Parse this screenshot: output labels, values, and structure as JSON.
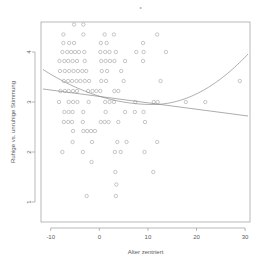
{
  "chart_data": {
    "type": "scatter",
    "title": "",
    "xlabel": "Alter zentriert",
    "ylabel": "Ruhige vs. unruhige Stimmung",
    "xlim": [
      -12,
      31
    ],
    "ylim": [
      0.6,
      4.6
    ],
    "xticks": [
      -10,
      0,
      10,
      20,
      30
    ],
    "xticklabels": [
      "-10",
      "0",
      "10",
      "20",
      "30"
    ],
    "yticks": [
      1,
      2,
      3,
      4
    ],
    "yticklabels": [
      "1",
      "2",
      "3",
      "4"
    ],
    "grid": false,
    "legend": "none",
    "point_marker": "open-circle",
    "point_color": "#9a9a9a",
    "line_color": "#8a8a8a",
    "points": [
      [
        -5.2,
        4.55
      ],
      [
        -3.3,
        4.55
      ],
      [
        -7.4,
        4.35
      ],
      [
        -3.3,
        4.35
      ],
      [
        1.1,
        4.35
      ],
      [
        3.0,
        4.35
      ],
      [
        11.9,
        4.35
      ],
      [
        -7.4,
        4.18
      ],
      [
        -6.2,
        4.18
      ],
      [
        -5.2,
        4.18
      ],
      [
        0.3,
        4.18
      ],
      [
        1.5,
        4.18
      ],
      [
        9.0,
        4.18
      ],
      [
        -7.6,
        4.0
      ],
      [
        -6.6,
        4.0
      ],
      [
        -5.8,
        4.0
      ],
      [
        -5.0,
        4.0
      ],
      [
        -4.2,
        4.0
      ],
      [
        -3.1,
        4.0
      ],
      [
        0.2,
        4.0
      ],
      [
        1.2,
        4.0
      ],
      [
        2.1,
        4.0
      ],
      [
        3.4,
        4.0
      ],
      [
        7.6,
        4.0
      ],
      [
        9.1,
        4.0
      ],
      [
        13.7,
        4.0
      ],
      [
        -8.2,
        3.82
      ],
      [
        -7.2,
        3.82
      ],
      [
        -6.4,
        3.82
      ],
      [
        -5.5,
        3.82
      ],
      [
        -4.6,
        3.82
      ],
      [
        -3.0,
        3.82
      ],
      [
        0.4,
        3.82
      ],
      [
        1.3,
        3.82
      ],
      [
        2.2,
        3.82
      ],
      [
        3.1,
        3.82
      ],
      [
        5.3,
        3.82
      ],
      [
        9.0,
        3.82
      ],
      [
        -8.1,
        3.62
      ],
      [
        -7.1,
        3.62
      ],
      [
        -6.2,
        3.62
      ],
      [
        -5.3,
        3.62
      ],
      [
        -4.4,
        3.62
      ],
      [
        -3.5,
        3.62
      ],
      [
        -2.7,
        3.62
      ],
      [
        0.5,
        3.62
      ],
      [
        1.6,
        3.62
      ],
      [
        4.5,
        3.62
      ],
      [
        -7.3,
        3.42
      ],
      [
        -6.4,
        3.42
      ],
      [
        -5.6,
        3.42
      ],
      [
        -4.7,
        3.42
      ],
      [
        -3.9,
        3.42
      ],
      [
        -3.0,
        3.42
      ],
      [
        -2.1,
        3.42
      ],
      [
        0.4,
        3.42
      ],
      [
        1.4,
        3.42
      ],
      [
        5.0,
        3.42
      ],
      [
        12.6,
        3.42
      ],
      [
        28.9,
        3.42
      ],
      [
        -8.0,
        3.22
      ],
      [
        -7.1,
        3.22
      ],
      [
        -6.3,
        3.22
      ],
      [
        -5.4,
        3.22
      ],
      [
        -4.6,
        3.22
      ],
      [
        -2.3,
        3.22
      ],
      [
        -1.4,
        3.22
      ],
      [
        -0.6,
        3.22
      ],
      [
        0.2,
        3.22
      ],
      [
        3.1,
        3.22
      ],
      [
        3.9,
        3.22
      ],
      [
        -8.3,
        3.0
      ],
      [
        -6.3,
        3.0
      ],
      [
        -5.4,
        3.0
      ],
      [
        -4.5,
        3.0
      ],
      [
        -2.2,
        3.0
      ],
      [
        1.2,
        3.0
      ],
      [
        2.1,
        3.0
      ],
      [
        3.0,
        3.0
      ],
      [
        7.4,
        3.0
      ],
      [
        11.2,
        3.0
      ],
      [
        12.0,
        3.0
      ],
      [
        17.8,
        3.0
      ],
      [
        21.8,
        3.0
      ],
      [
        -7.2,
        2.8
      ],
      [
        -6.3,
        2.8
      ],
      [
        -5.5,
        2.8
      ],
      [
        -3.3,
        2.8
      ],
      [
        1.3,
        2.8
      ],
      [
        5.3,
        2.8
      ],
      [
        7.3,
        2.8
      ],
      [
        9.1,
        2.8
      ],
      [
        -7.3,
        2.6
      ],
      [
        -6.4,
        2.6
      ],
      [
        -5.6,
        2.6
      ],
      [
        -3.4,
        2.6
      ],
      [
        0.3,
        2.6
      ],
      [
        1.1,
        2.6
      ],
      [
        1.9,
        2.6
      ],
      [
        3.9,
        2.6
      ],
      [
        9.4,
        2.6
      ],
      [
        -5.4,
        2.42
      ],
      [
        -3.3,
        2.42
      ],
      [
        -2.5,
        2.42
      ],
      [
        -1.7,
        2.42
      ],
      [
        -0.9,
        2.42
      ],
      [
        -5.5,
        2.2
      ],
      [
        -1.5,
        2.2
      ],
      [
        3.7,
        2.2
      ],
      [
        5.6,
        2.2
      ],
      [
        11.9,
        2.2
      ],
      [
        -7.6,
        2.0
      ],
      [
        -3.4,
        2.0
      ],
      [
        3.2,
        2.0
      ],
      [
        4.4,
        2.0
      ],
      [
        9.3,
        2.0
      ],
      [
        -1.6,
        1.8
      ],
      [
        3.3,
        1.6
      ],
      [
        11.1,
        1.6
      ],
      [
        3.5,
        1.35
      ],
      [
        -2.6,
        1.12
      ],
      [
        3.4,
        1.12
      ]
    ],
    "fits": [
      {
        "name": "linear-fit",
        "kind": "line",
        "endpoints_data": [
          [
            -11.6,
            3.26
          ],
          [
            30.6,
            2.72
          ]
        ]
      },
      {
        "name": "quadratic-fit",
        "kind": "quadratic",
        "vertex_data": [
          11.0,
          2.95
        ],
        "endpoints_data": [
          [
            -11.6,
            3.65
          ],
          [
            30.6,
            3.96
          ]
        ]
      }
    ],
    "top_mark": {
      "x_data": 8.5,
      "note": "faint mark above plot"
    }
  }
}
